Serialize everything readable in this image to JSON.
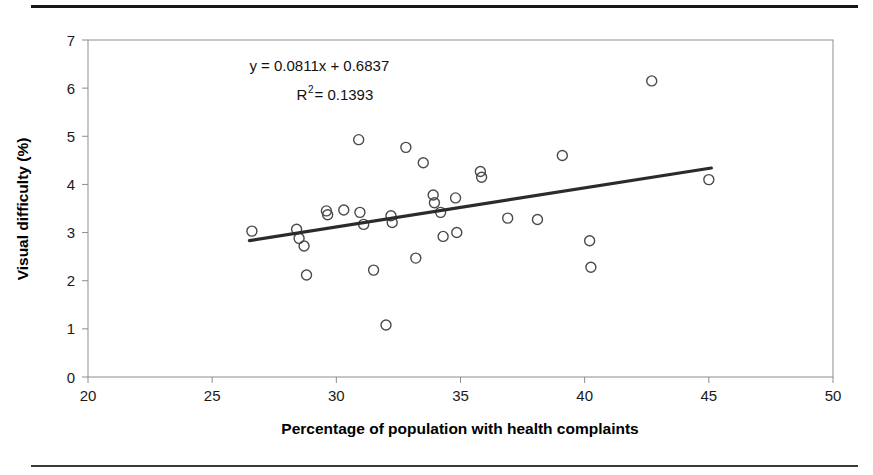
{
  "figure": {
    "rules": {
      "top_rule": "thick-black-rule",
      "bottom_rule": "thin-black-rule"
    }
  },
  "chart_data": {
    "type": "scatter",
    "title": "",
    "xlabel": "Percentage of population with health complaints",
    "ylabel": "Visual difficulty (%)",
    "xlim": [
      20,
      50
    ],
    "ylim": [
      0,
      7
    ],
    "xticks": [
      20,
      25,
      30,
      35,
      40,
      45,
      50
    ],
    "yticks": [
      0,
      1,
      2,
      3,
      4,
      5,
      6,
      7
    ],
    "xtick_labels": [
      "20",
      "25",
      "30",
      "35",
      "40",
      "45",
      "50"
    ],
    "ytick_labels": [
      "0",
      "1",
      "2",
      "3",
      "4",
      "5",
      "6",
      "7"
    ],
    "grid": false,
    "legend": "none",
    "marker": "open-circle",
    "annotations": [
      {
        "id": "equation",
        "text": "y = 0.0811x + 0.6837",
        "x": 26.5,
        "y": 6.35
      },
      {
        "id": "r-squared",
        "text_before": "R",
        "superscript": "2",
        "text_after": " = 0.1393",
        "x": 28.4,
        "y": 5.75
      }
    ],
    "trendline": {
      "type": "linear",
      "equation": "y = 0.0811x + 0.6837",
      "slope": 0.0811,
      "intercept": 0.6837,
      "r_squared": 0.1393,
      "x_start": 26.5,
      "x_end": 45.1,
      "color": "#2b2b2b"
    },
    "points": [
      {
        "x": 26.6,
        "y": 3.03
      },
      {
        "x": 28.4,
        "y": 3.07
      },
      {
        "x": 28.5,
        "y": 2.88
      },
      {
        "x": 28.7,
        "y": 2.72
      },
      {
        "x": 28.8,
        "y": 2.12
      },
      {
        "x": 29.6,
        "y": 3.45
      },
      {
        "x": 29.65,
        "y": 3.37
      },
      {
        "x": 30.3,
        "y": 3.47
      },
      {
        "x": 30.9,
        "y": 4.93
      },
      {
        "x": 30.95,
        "y": 3.42
      },
      {
        "x": 31.1,
        "y": 3.17
      },
      {
        "x": 31.5,
        "y": 2.22
      },
      {
        "x": 32.0,
        "y": 1.08
      },
      {
        "x": 32.2,
        "y": 3.35
      },
      {
        "x": 32.25,
        "y": 3.21
      },
      {
        "x": 32.8,
        "y": 4.77
      },
      {
        "x": 33.2,
        "y": 2.47
      },
      {
        "x": 33.5,
        "y": 4.45
      },
      {
        "x": 33.9,
        "y": 3.78
      },
      {
        "x": 33.95,
        "y": 3.62
      },
      {
        "x": 34.2,
        "y": 3.42
      },
      {
        "x": 34.3,
        "y": 2.92
      },
      {
        "x": 34.8,
        "y": 3.72
      },
      {
        "x": 34.85,
        "y": 3.0
      },
      {
        "x": 35.8,
        "y": 4.27
      },
      {
        "x": 35.85,
        "y": 4.15
      },
      {
        "x": 36.9,
        "y": 3.3
      },
      {
        "x": 38.1,
        "y": 3.27
      },
      {
        "x": 39.1,
        "y": 4.6
      },
      {
        "x": 40.2,
        "y": 2.83
      },
      {
        "x": 40.25,
        "y": 2.28
      },
      {
        "x": 42.7,
        "y": 6.15
      },
      {
        "x": 45.0,
        "y": 4.1
      }
    ]
  }
}
